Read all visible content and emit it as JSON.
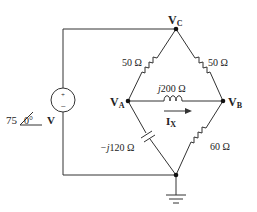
{
  "diagram": {
    "type": "ac-circuit-bridge",
    "colors": {
      "wire": "#333333",
      "text": "#222222",
      "background": "#ffffff"
    },
    "nodes": {
      "vc": {
        "label_main": "V",
        "label_sub": "C"
      },
      "va": {
        "label_main": "V",
        "label_sub": "A"
      },
      "vb": {
        "label_main": "V",
        "label_sub": "B"
      },
      "ground": {
        "label": ""
      }
    },
    "source": {
      "magnitude": "75",
      "angle": "0°",
      "unit": "V",
      "plus": "+",
      "minus": "−"
    },
    "components": {
      "r_vc_va": {
        "value": "50 Ω"
      },
      "r_vc_vb": {
        "value": "50 Ω"
      },
      "l_va_vb": {
        "prefix": "j",
        "value": "200 Ω"
      },
      "c_va_gnd": {
        "prefix": "−j",
        "value": "120 Ω"
      },
      "r_vb_gnd": {
        "value": "60 Ω"
      }
    },
    "current": {
      "label_main": "I",
      "label_sub": "X"
    }
  }
}
